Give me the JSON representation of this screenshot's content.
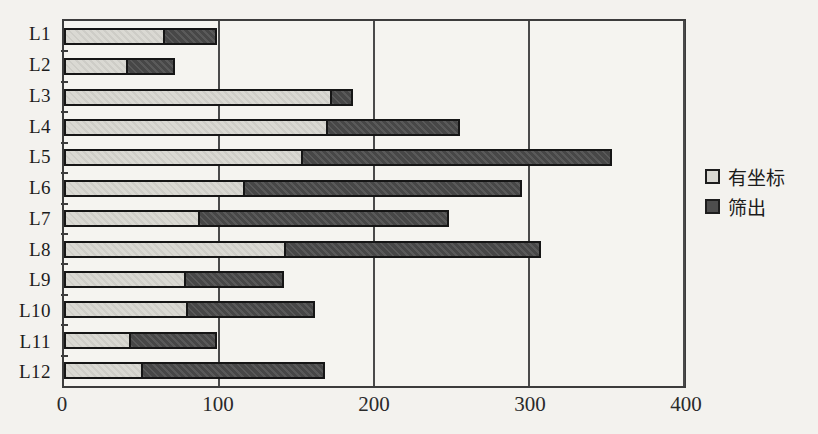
{
  "chart_data": {
    "type": "bar",
    "orientation": "horizontal",
    "stacked": true,
    "title": "",
    "xlabel": "",
    "ylabel": "",
    "categories": [
      "L1",
      "L2",
      "L3",
      "L4",
      "L5",
      "L6",
      "L7",
      "L8",
      "L9",
      "L10",
      "L11",
      "L12"
    ],
    "series": [
      {
        "name": "有坐标",
        "color": "#d9d8d2",
        "values": [
          65,
          41,
          173,
          170,
          154,
          117,
          88,
          143,
          79,
          80,
          43,
          51
        ]
      },
      {
        "name": "筛出",
        "color": "#4d4d4d",
        "values": [
          35,
          32,
          15,
          87,
          201,
          180,
          162,
          166,
          64,
          83,
          57,
          119
        ]
      }
    ],
    "stack_totals": [
      100,
      73,
      188,
      257,
      355,
      297,
      250,
      309,
      143,
      163,
      100,
      170
    ],
    "xlim": [
      0,
      400
    ],
    "xticks": [
      0,
      100,
      200,
      300,
      400
    ],
    "grid": "vertical-major",
    "legend_position": "right"
  },
  "colors": {
    "background": "#f3f2ee",
    "plot_border": "#3c3c3c",
    "gridline": "#4a4a4a",
    "series_light": "#d9d8d2",
    "series_dark": "#4d4d4d",
    "text": "#1c1c1c"
  }
}
